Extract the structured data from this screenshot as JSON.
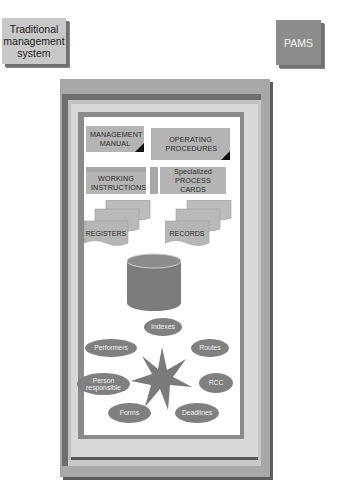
{
  "top_boxes": {
    "traditional": "Traditional management system",
    "pams": "PAMS"
  },
  "documents": {
    "management_manual": "MANAGEMENT MANUAL",
    "operating_procedures": "OPERATING PROCEDURES",
    "working_instructions": "WORKING INSTRUCTIONS",
    "specialized_process_cards": "Specialized PROCESS CARDS",
    "registers": "REGISTERS",
    "records": "RECORDS"
  },
  "database_icon": "cylinder-database",
  "star_items": [
    {
      "label": "Indexes"
    },
    {
      "label": "Routes"
    },
    {
      "label": "RCC"
    },
    {
      "label": "Deadlines"
    },
    {
      "label": "Forms"
    },
    {
      "label": "Person responsible"
    },
    {
      "label": "Performers"
    }
  ],
  "colors": {
    "frame_dark": "#6e6e6e",
    "frame_mid": "#a8a8a8",
    "card_fill": "#b4b4b4",
    "ellipse_fill": "#808080",
    "star_fill": "#7a7a7a"
  }
}
